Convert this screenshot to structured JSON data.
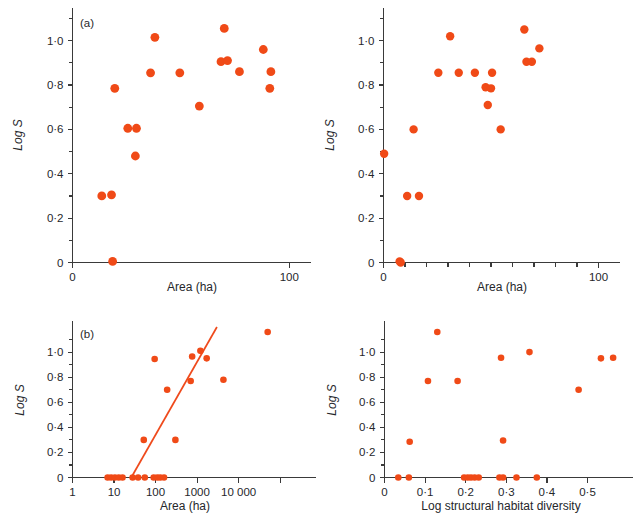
{
  "figure": {
    "background": "#ffffff",
    "marker_color": "#f04a17",
    "line_color": "#ef4a1c",
    "axis_color": "#3a3a3a"
  },
  "panels": [
    {
      "id": "panel-a-top-left",
      "label": "(a)",
      "chart_data": {
        "type": "scatter",
        "title": "",
        "xlabel": "Area (ha)",
        "ylabel": "Log S",
        "xlim": [
          0,
          110
        ],
        "ylim": [
          0,
          1.12
        ],
        "grid": false,
        "legend": "none",
        "xticks": [
          0,
          100
        ],
        "xtick_labels": [
          "0",
          "100"
        ],
        "xminor_ticks": [],
        "yticks": [
          0,
          0.2,
          0.4,
          0.6,
          0.8,
          1.0
        ],
        "ytick_labels": [
          "0",
          "0·2",
          "0·4",
          "0·6",
          "0·8",
          "1·0"
        ],
        "yminor_ticks": [
          0.1,
          0.3,
          0.5,
          0.7,
          0.9,
          1.1
        ],
        "points": [
          {
            "x": 13.5,
            "y": 0.3
          },
          {
            "x": 18.0,
            "y": 0.305
          },
          {
            "x": 18.5,
            "y": 0.005
          },
          {
            "x": 19.5,
            "y": 0.785
          },
          {
            "x": 25.5,
            "y": 0.605
          },
          {
            "x": 29.5,
            "y": 0.605
          },
          {
            "x": 29.0,
            "y": 0.48
          },
          {
            "x": 36.0,
            "y": 0.855
          },
          {
            "x": 38.0,
            "y": 1.015
          },
          {
            "x": 49.5,
            "y": 0.855
          },
          {
            "x": 58.5,
            "y": 0.705
          },
          {
            "x": 68.5,
            "y": 0.905
          },
          {
            "x": 71.5,
            "y": 0.91
          },
          {
            "x": 70.0,
            "y": 1.055
          },
          {
            "x": 77.0,
            "y": 0.86
          },
          {
            "x": 88.0,
            "y": 0.96
          },
          {
            "x": 91.5,
            "y": 0.86
          },
          {
            "x": 91.0,
            "y": 0.785
          }
        ]
      }
    },
    {
      "id": "panel-top-right",
      "label": "",
      "chart_data": {
        "type": "scatter",
        "title": "",
        "xlabel": "Area (ha)",
        "ylabel": "Log S",
        "xlim": [
          0,
          110
        ],
        "ylim": [
          0,
          1.12
        ],
        "grid": false,
        "legend": "none",
        "xticks": [
          0,
          100
        ],
        "xtick_labels": [
          "0",
          "100"
        ],
        "xminor_ticks": [
          10,
          20,
          30,
          40,
          50,
          60,
          70,
          80,
          90
        ],
        "yticks": [
          0,
          0.2,
          0.4,
          0.6,
          0.8,
          1.0
        ],
        "ytick_labels": [
          "0",
          "0·2",
          "0·4",
          "0·6",
          "0·8",
          "1·0"
        ],
        "yminor_ticks": [
          0.1,
          0.3,
          0.5,
          0.7,
          0.9,
          1.1
        ],
        "points": [
          {
            "x": 0.3,
            "y": 0.49
          },
          {
            "x": 7.5,
            "y": 0.005
          },
          {
            "x": 8.0,
            "y": 0.0
          },
          {
            "x": 11.0,
            "y": 0.3
          },
          {
            "x": 16.5,
            "y": 0.3
          },
          {
            "x": 14.0,
            "y": 0.6
          },
          {
            "x": 25.5,
            "y": 0.855
          },
          {
            "x": 31.0,
            "y": 1.02
          },
          {
            "x": 35.0,
            "y": 0.855
          },
          {
            "x": 42.5,
            "y": 0.855
          },
          {
            "x": 47.5,
            "y": 0.79
          },
          {
            "x": 50.0,
            "y": 0.785
          },
          {
            "x": 48.5,
            "y": 0.71
          },
          {
            "x": 50.5,
            "y": 0.855
          },
          {
            "x": 54.5,
            "y": 0.6
          },
          {
            "x": 66.5,
            "y": 0.905
          },
          {
            "x": 69.0,
            "y": 0.905
          },
          {
            "x": 65.5,
            "y": 1.05
          },
          {
            "x": 72.5,
            "y": 0.965
          }
        ]
      }
    },
    {
      "id": "panel-b-bottom-left",
      "label": "(b)",
      "chart_data": {
        "type": "scatter",
        "title": "",
        "xlabel": "Area  (ha)",
        "ylabel": "Log S",
        "xscale": "log",
        "xlim": [
          1,
          300000
        ],
        "ylim": [
          0,
          1.2
        ],
        "grid": false,
        "legend": "none",
        "xticks": [
          1,
          10,
          100,
          1000,
          10000,
          100000
        ],
        "xtick_labels": [
          "1",
          "10",
          "100",
          "1000",
          "10 000",
          ""
        ],
        "yticks": [
          0,
          0.2,
          0.4,
          0.6,
          0.8,
          1.0
        ],
        "ytick_labels": [
          "0",
          "0·2",
          "0·4",
          "0·6",
          "0·8",
          "1·0"
        ],
        "yminor_ticks": [
          0.1,
          0.3,
          0.5,
          0.7,
          0.9,
          1.1
        ],
        "points": [
          {
            "x": 7.0,
            "y": 0.0
          },
          {
            "x": 8.5,
            "y": 0.0
          },
          {
            "x": 10.5,
            "y": 0.0
          },
          {
            "x": 13.0,
            "y": 0.0
          },
          {
            "x": 16.0,
            "y": 0.0
          },
          {
            "x": 28.0,
            "y": 0.0
          },
          {
            "x": 38.0,
            "y": 0.0
          },
          {
            "x": 55.0,
            "y": 0.0
          },
          {
            "x": 90.0,
            "y": 0.0
          },
          {
            "x": 110.0,
            "y": 0.0
          },
          {
            "x": 130.0,
            "y": 0.0
          },
          {
            "x": 160.0,
            "y": 0.0
          },
          {
            "x": 52.0,
            "y": 0.3
          },
          {
            "x": 300.0,
            "y": 0.3
          },
          {
            "x": 95.0,
            "y": 0.945
          },
          {
            "x": 190.0,
            "y": 0.7
          },
          {
            "x": 700.0,
            "y": 0.77
          },
          {
            "x": 760.0,
            "y": 0.965
          },
          {
            "x": 1200.0,
            "y": 1.01
          },
          {
            "x": 1700.0,
            "y": 0.95
          },
          {
            "x": 4300.0,
            "y": 0.78
          },
          {
            "x": 50000.0,
            "y": 1.16
          }
        ],
        "fit_line": {
          "x_start": 26.0,
          "y_start": 0.0,
          "x_end": 3000.0,
          "y_end": 1.2
        }
      }
    },
    {
      "id": "panel-bottom-right",
      "label": "",
      "chart_data": {
        "type": "scatter",
        "title": "",
        "xlabel": "Log structural habitat diversity",
        "ylabel": "Log S",
        "xlim": [
          0,
          0.575
        ],
        "ylim": [
          0,
          1.2
        ],
        "grid": false,
        "legend": "none",
        "xticks": [
          0,
          0.1,
          0.2,
          0.3,
          0.4,
          0.5
        ],
        "xtick_labels": [
          "0",
          "0·1",
          "0·2",
          "0·3",
          "0·4",
          "0·5"
        ],
        "yticks": [
          0,
          0.2,
          0.4,
          0.6,
          0.8,
          1.0
        ],
        "ytick_labels": [
          "0",
          "0·2",
          "0·4",
          "0·6",
          "0·8",
          "1·0"
        ],
        "yminor_ticks": [
          0.1,
          0.3,
          0.5,
          0.7,
          0.9,
          1.1
        ],
        "points": [
          {
            "x": 0.034,
            "y": 0.0
          },
          {
            "x": 0.06,
            "y": 0.0
          },
          {
            "x": 0.196,
            "y": 0.0
          },
          {
            "x": 0.205,
            "y": 0.0
          },
          {
            "x": 0.213,
            "y": 0.0
          },
          {
            "x": 0.222,
            "y": 0.0
          },
          {
            "x": 0.232,
            "y": 0.0
          },
          {
            "x": 0.283,
            "y": 0.0
          },
          {
            "x": 0.292,
            "y": 0.0
          },
          {
            "x": 0.325,
            "y": 0.0
          },
          {
            "x": 0.375,
            "y": 0.0
          },
          {
            "x": 0.062,
            "y": 0.285
          },
          {
            "x": 0.292,
            "y": 0.295
          },
          {
            "x": 0.107,
            "y": 0.77
          },
          {
            "x": 0.18,
            "y": 0.77
          },
          {
            "x": 0.13,
            "y": 1.16
          },
          {
            "x": 0.287,
            "y": 0.955
          },
          {
            "x": 0.357,
            "y": 1.0
          },
          {
            "x": 0.478,
            "y": 0.7
          },
          {
            "x": 0.533,
            "y": 0.95
          },
          {
            "x": 0.563,
            "y": 0.955
          }
        ]
      }
    }
  ]
}
